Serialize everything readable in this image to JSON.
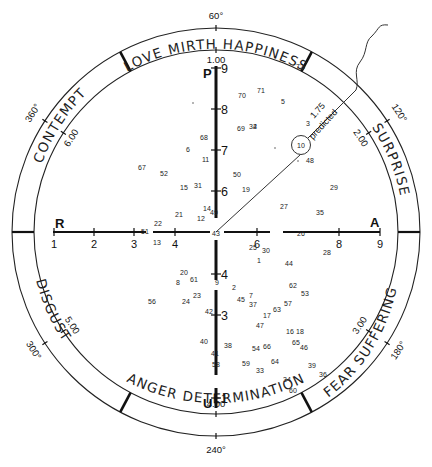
{
  "diagram": {
    "sectors": [
      {
        "label": "LOVE MIRTH HAPPINESS"
      },
      {
        "label": "SURPRISE"
      },
      {
        "label": "FEAR SUFFERING"
      },
      {
        "label": "ANGER DETERMINATION"
      },
      {
        "label": "DISGUST"
      },
      {
        "label": "CONTEMPT"
      }
    ],
    "degree_marks": [
      "60°",
      "120°",
      "180°",
      "240°",
      "300°",
      "360°"
    ],
    "scale_values": [
      "1.00",
      "1.75",
      "2.00",
      "3.00",
      "4.00",
      "5.00",
      "6.00"
    ],
    "vertical_axis": {
      "top_pole": "P",
      "bottom_pole": "U",
      "ticks": [
        "9",
        "8",
        "7",
        "6",
        "4",
        "3",
        "1"
      ]
    },
    "horizontal_axis": {
      "left_pole": "R",
      "right_pole": "A",
      "ticks": [
        "1",
        "2",
        "3",
        "4",
        "6",
        "8",
        "9"
      ]
    },
    "prediction": {
      "value": "1.75",
      "label": "predicted",
      "circled_point": "10"
    },
    "points": [
      "72",
      "70",
      "71",
      "5",
      "69",
      "32",
      "4",
      "3",
      "68",
      "6",
      "11",
      "48",
      "67",
      "52",
      "50",
      "15",
      "31",
      "19",
      "29",
      "14",
      "49",
      "12",
      "21",
      "27",
      "35",
      "22",
      "51",
      "13",
      "43",
      "26",
      "25",
      "30",
      "28",
      "1",
      "44",
      "20",
      "61",
      "8",
      "9",
      "2",
      "62",
      "53",
      "23",
      "24",
      "56",
      "45",
      "7",
      "37",
      "57",
      "63",
      "42",
      "17",
      "47",
      "16",
      "18",
      "40",
      "38",
      "54",
      "66",
      "65",
      "46",
      "41",
      "58",
      "59",
      "64",
      "33",
      "39",
      "36",
      "34",
      "60"
    ]
  }
}
